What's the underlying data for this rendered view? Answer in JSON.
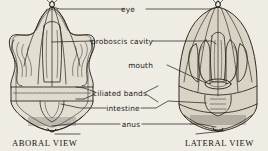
{
  "figure": {
    "background_color": "#efece4",
    "ink_color": "#26221c",
    "medium": "engraved line drawing on aged paper"
  },
  "labels": [
    {
      "id": "eye",
      "text": "eye",
      "x": 131,
      "y": 11,
      "leader": "both-sides",
      "points_to": [
        "aboral-view-apex",
        "lateral-view-apex"
      ]
    },
    {
      "id": "proboscis-cavity",
      "text": "proboscis cavity",
      "x": 96,
      "y": 43,
      "leader": "both-sides",
      "points_to": [
        "aboral-view-center",
        "lateral-view-center"
      ]
    },
    {
      "id": "mouth",
      "text": "mouth",
      "x": 142,
      "y": 67,
      "leader": "right",
      "points_to": [
        "lateral-view-mouth"
      ]
    },
    {
      "id": "ciliated-bands",
      "text": "ciliated bands",
      "x": 100,
      "y": 95,
      "leader": "bracket-both",
      "points_to": [
        "aboral-view-bands",
        "lateral-view-bands"
      ]
    },
    {
      "id": "intestine",
      "text": "intestine",
      "x": 110,
      "y": 110,
      "leader": "both-sides",
      "points_to": [
        "aboral-view-intestine",
        "lateral-view-intestine"
      ]
    },
    {
      "id": "anus",
      "text": "anus",
      "x": 126,
      "y": 125,
      "leader": "both-sides",
      "points_to": [
        "aboral-view-anus",
        "lateral-view-anus"
      ]
    }
  ],
  "captions": [
    {
      "id": "aboral",
      "text": "ABORAL VIEW",
      "x": 12,
      "y": 145
    },
    {
      "id": "lateral",
      "text": "LATERAL VIEW",
      "x": 185,
      "y": 145
    }
  ],
  "views": [
    {
      "id": "aboral-view",
      "caption": "ABORAL VIEW",
      "shape": "four-lobed bilaterally symmetric body",
      "center_x": 52,
      "center_y": 68
    },
    {
      "id": "lateral-view",
      "caption": "LATERAL VIEW",
      "shape": "bell-shaped dome with internal loops",
      "center_x": 218,
      "center_y": 68
    }
  ]
}
